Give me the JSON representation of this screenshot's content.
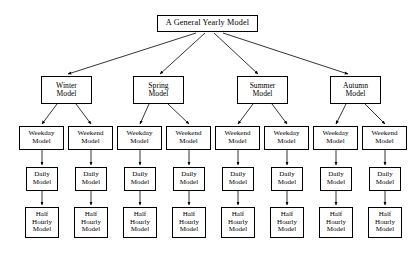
{
  "diagram": {
    "title": "A General Yearly Model",
    "type": "hierarchy-tree",
    "levels": [
      {
        "name": "root",
        "nodes": [
          {
            "id": "root",
            "label": "A General Yearly Model",
            "x": 157,
            "y": 15,
            "w": 101,
            "h": 17
          }
        ]
      },
      {
        "name": "season",
        "nodes": [
          {
            "id": "winter",
            "label": "Winter\nModel",
            "x": 41,
            "y": 76,
            "w": 51,
            "h": 28
          },
          {
            "id": "spring",
            "label": "Spring\nModel",
            "x": 133,
            "y": 76,
            "w": 51,
            "h": 28
          },
          {
            "id": "summer",
            "label": "Summer\nModel",
            "x": 237,
            "y": 76,
            "w": 51,
            "h": 28
          },
          {
            "id": "autumn",
            "label": "Autumn\nModel",
            "x": 330,
            "y": 76,
            "w": 51,
            "h": 28
          }
        ]
      },
      {
        "name": "daytype",
        "nodes": [
          {
            "id": "dt1",
            "label": "Weekday\nModel",
            "x": 19,
            "y": 126,
            "w": 45,
            "h": 24
          },
          {
            "id": "dt2",
            "label": "Weekend\nModel",
            "x": 68,
            "y": 126,
            "w": 45,
            "h": 24
          },
          {
            "id": "dt3",
            "label": "Weekday\nModel",
            "x": 117,
            "y": 126,
            "w": 45,
            "h": 24
          },
          {
            "id": "dt4",
            "label": "Weekend\nModel",
            "x": 166,
            "y": 126,
            "w": 45,
            "h": 24
          },
          {
            "id": "dt5",
            "label": "Weekend\nModel",
            "x": 215,
            "y": 126,
            "w": 45,
            "h": 24
          },
          {
            "id": "dt6",
            "label": "Weekday\nModel",
            "x": 264,
            "y": 126,
            "w": 45,
            "h": 24
          },
          {
            "id": "dt7",
            "label": "Weekday\nModel",
            "x": 313,
            "y": 126,
            "w": 45,
            "h": 24
          },
          {
            "id": "dt8",
            "label": "Weekend\nModel",
            "x": 362,
            "y": 126,
            "w": 45,
            "h": 24
          }
        ]
      },
      {
        "name": "daily",
        "nodes": [
          {
            "id": "d1",
            "label": "Daily\nModel",
            "x": 26,
            "y": 167,
            "w": 32,
            "h": 24
          },
          {
            "id": "d2",
            "label": "Daily\nModel",
            "x": 75,
            "y": 167,
            "w": 32,
            "h": 24
          },
          {
            "id": "d3",
            "label": "Daily\nModel",
            "x": 124,
            "y": 167,
            "w": 32,
            "h": 24
          },
          {
            "id": "d4",
            "label": "Daily\nModel",
            "x": 173,
            "y": 167,
            "w": 32,
            "h": 24
          },
          {
            "id": "d5",
            "label": "Daily\nModel",
            "x": 222,
            "y": 167,
            "w": 32,
            "h": 24
          },
          {
            "id": "d6",
            "label": "Daily\nModel",
            "x": 271,
            "y": 167,
            "w": 32,
            "h": 24
          },
          {
            "id": "d7",
            "label": "Daily\nModel",
            "x": 320,
            "y": 167,
            "w": 32,
            "h": 24
          },
          {
            "id": "d8",
            "label": "Daily\nModel",
            "x": 369,
            "y": 167,
            "w": 32,
            "h": 24
          }
        ]
      },
      {
        "name": "halfhourly",
        "nodes": [
          {
            "id": "h1",
            "label": "Half\nHourly\nModel",
            "x": 25,
            "y": 207,
            "w": 34,
            "h": 31
          },
          {
            "id": "h2",
            "label": "Half\nHourly\nModel",
            "x": 74,
            "y": 207,
            "w": 34,
            "h": 31
          },
          {
            "id": "h3",
            "label": "Half\nHourly\nModel",
            "x": 123,
            "y": 207,
            "w": 34,
            "h": 31
          },
          {
            "id": "h4",
            "label": "Half\nHourly\nModel",
            "x": 172,
            "y": 207,
            "w": 34,
            "h": 31
          },
          {
            "id": "h5",
            "label": "Half\nHourly\nModel",
            "x": 221,
            "y": 207,
            "w": 34,
            "h": 31
          },
          {
            "id": "h6",
            "label": "Half\nHourly\nModel",
            "x": 270,
            "y": 207,
            "w": 34,
            "h": 31
          },
          {
            "id": "h7",
            "label": "Half\nHourly\nModel",
            "x": 319,
            "y": 207,
            "w": 34,
            "h": 31
          },
          {
            "id": "h8",
            "label": "Half\nHourly\nModel",
            "x": 368,
            "y": 207,
            "w": 34,
            "h": 31
          }
        ]
      }
    ],
    "edges": [
      {
        "from": "root",
        "to": "winter",
        "x1": 196,
        "y1": 33,
        "x2": 68,
        "y2": 74
      },
      {
        "from": "root",
        "to": "spring",
        "x1": 205,
        "y1": 33,
        "x2": 160,
        "y2": 74
      },
      {
        "from": "root",
        "to": "summer",
        "x1": 214,
        "y1": 33,
        "x2": 258,
        "y2": 74
      },
      {
        "from": "root",
        "to": "autumn",
        "x1": 223,
        "y1": 33,
        "x2": 348,
        "y2": 74
      },
      {
        "from": "winter",
        "to": "dt1",
        "x1": 57,
        "y1": 104,
        "x2": 42,
        "y2": 124
      },
      {
        "from": "winter",
        "to": "dt2",
        "x1": 76,
        "y1": 104,
        "x2": 91,
        "y2": 124
      },
      {
        "from": "spring",
        "to": "dt3",
        "x1": 149,
        "y1": 104,
        "x2": 140,
        "y2": 124
      },
      {
        "from": "spring",
        "to": "dt4",
        "x1": 168,
        "y1": 104,
        "x2": 189,
        "y2": 124
      },
      {
        "from": "summer",
        "to": "dt5",
        "x1": 253,
        "y1": 104,
        "x2": 238,
        "y2": 124
      },
      {
        "from": "summer",
        "to": "dt6",
        "x1": 272,
        "y1": 104,
        "x2": 287,
        "y2": 124
      },
      {
        "from": "autumn",
        "to": "dt7",
        "x1": 346,
        "y1": 104,
        "x2": 336,
        "y2": 124
      },
      {
        "from": "autumn",
        "to": "dt8",
        "x1": 365,
        "y1": 104,
        "x2": 385,
        "y2": 124
      },
      {
        "from": "dt1",
        "to": "d1",
        "x1": 42,
        "y1": 150,
        "x2": 42,
        "y2": 165
      },
      {
        "from": "dt2",
        "to": "d2",
        "x1": 91,
        "y1": 150,
        "x2": 91,
        "y2": 165
      },
      {
        "from": "dt3",
        "to": "d3",
        "x1": 140,
        "y1": 150,
        "x2": 140,
        "y2": 165
      },
      {
        "from": "dt4",
        "to": "d4",
        "x1": 189,
        "y1": 150,
        "x2": 189,
        "y2": 165
      },
      {
        "from": "dt5",
        "to": "d5",
        "x1": 238,
        "y1": 150,
        "x2": 238,
        "y2": 165
      },
      {
        "from": "dt6",
        "to": "d6",
        "x1": 287,
        "y1": 150,
        "x2": 287,
        "y2": 165
      },
      {
        "from": "dt7",
        "to": "d7",
        "x1": 336,
        "y1": 150,
        "x2": 336,
        "y2": 165
      },
      {
        "from": "dt8",
        "to": "d8",
        "x1": 385,
        "y1": 150,
        "x2": 385,
        "y2": 165
      },
      {
        "from": "d1",
        "to": "h1",
        "x1": 42,
        "y1": 191,
        "x2": 42,
        "y2": 205
      },
      {
        "from": "d2",
        "to": "h2",
        "x1": 91,
        "y1": 191,
        "x2": 91,
        "y2": 205
      },
      {
        "from": "d3",
        "to": "h3",
        "x1": 140,
        "y1": 191,
        "x2": 140,
        "y2": 205
      },
      {
        "from": "d4",
        "to": "h4",
        "x1": 189,
        "y1": 191,
        "x2": 189,
        "y2": 205
      },
      {
        "from": "d5",
        "to": "h5",
        "x1": 238,
        "y1": 191,
        "x2": 238,
        "y2": 205
      },
      {
        "from": "d6",
        "to": "h6",
        "x1": 287,
        "y1": 191,
        "x2": 287,
        "y2": 205
      },
      {
        "from": "d7",
        "to": "h7",
        "x1": 336,
        "y1": 191,
        "x2": 336,
        "y2": 205
      },
      {
        "from": "d8",
        "to": "h8",
        "x1": 385,
        "y1": 191,
        "x2": 385,
        "y2": 205
      }
    ],
    "colors": {
      "background": "#ffffff",
      "box_border": "#000000",
      "box_fill": "#ffffff",
      "edge": "#000000",
      "text": "#000000"
    }
  }
}
